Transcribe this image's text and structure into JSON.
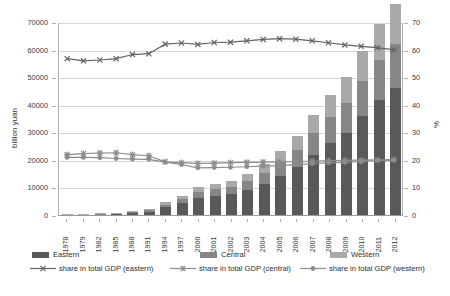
{
  "chart_data": {
    "type": "bar",
    "title": "",
    "subtitle": "",
    "xlabel": "",
    "ylabel": "billion yuan",
    "y2label": "%",
    "ylim": [
      0,
      70000
    ],
    "y2lim": [
      0,
      70
    ],
    "grid": true,
    "legend_position": "bottom",
    "stacked": true,
    "categories": [
      "1978",
      "1979",
      "1982",
      "1985",
      "1988",
      "1991",
      "1994",
      "1997",
      "2000",
      "2001",
      "2002",
      "2003",
      "2004",
      "2005",
      "2006",
      "2007",
      "2008",
      "2009",
      "2010",
      "2011",
      "2012"
    ],
    "yticks": [
      0,
      10000,
      20000,
      30000,
      40000,
      50000,
      60000,
      70000
    ],
    "y2ticks": [
      0,
      10,
      20,
      30,
      40,
      50,
      60,
      70
    ],
    "series": [
      {
        "name": "Eastern",
        "type": "bar",
        "axis": "left",
        "color": "#595959",
        "values": [
          180,
          200,
          260,
          410,
          800,
          1200,
          2800,
          4200,
          6200,
          7000,
          7600,
          9100,
          11300,
          14200,
          17300,
          21800,
          26000,
          29600,
          35800,
          41800,
          46000
        ]
      },
      {
        "name": "Central",
        "type": "bar",
        "axis": "left",
        "color": "#868686",
        "values": [
          70,
          80,
          100,
          160,
          300,
          450,
          1000,
          1500,
          2100,
          2400,
          2600,
          3100,
          3900,
          5000,
          6200,
          7800,
          9500,
          11000,
          12800,
          14600,
          16200
        ]
      },
      {
        "name": "Western",
        "type": "bar",
        "axis": "left",
        "color": "#a9a9a9",
        "values": [
          60,
          70,
          90,
          140,
          260,
          380,
          850,
          1300,
          1800,
          2000,
          2200,
          2600,
          3300,
          4200,
          5200,
          6600,
          8000,
          9400,
          11000,
          12700,
          14200
        ]
      },
      {
        "name": "share in total GDP (eastern)",
        "type": "line",
        "axis": "right",
        "marker": "x",
        "color": "#636363",
        "values": [
          57.0,
          56.2,
          56.5,
          57.0,
          58.5,
          58.8,
          62.3,
          62.7,
          62.2,
          62.9,
          63.0,
          63.5,
          64.0,
          64.3,
          64.1,
          63.5,
          62.8,
          62.0,
          61.5,
          61.0,
          60.2
        ]
      },
      {
        "name": "share in total GDP (central)",
        "type": "line",
        "axis": "right",
        "marker": "asterisk",
        "color": "#8c8c8c",
        "values": [
          22.0,
          22.4,
          22.6,
          22.7,
          22.0,
          21.6,
          19.4,
          19.1,
          18.8,
          18.9,
          19.1,
          19.2,
          19.3,
          19.4,
          19.5,
          19.6,
          19.8,
          19.9,
          20.0,
          20.1,
          20.2
        ]
      },
      {
        "name": "share in total GDP (western)",
        "type": "line",
        "axis": "right",
        "marker": "circle",
        "color": "#8c8c8c",
        "values": [
          21.0,
          21.0,
          20.9,
          20.6,
          20.4,
          20.3,
          19.3,
          18.4,
          17.2,
          17.3,
          17.4,
          17.6,
          17.8,
          18.0,
          18.4,
          18.7,
          19.0,
          19.2,
          19.5,
          19.8,
          20.0
        ]
      }
    ],
    "legend": [
      {
        "label": "Eastern",
        "kind": "swatch",
        "color": "#595959"
      },
      {
        "label": "Central",
        "kind": "swatch",
        "color": "#868686"
      },
      {
        "label": "Western",
        "kind": "swatch",
        "color": "#a9a9a9"
      },
      {
        "label": "share in total GDP (eastern)",
        "kind": "line",
        "marker": "x",
        "color": "#636363"
      },
      {
        "label": "share in total GDP (central)",
        "kind": "line",
        "marker": "asterisk",
        "color": "#8c8c8c"
      },
      {
        "label": "share in total GDP (western)",
        "kind": "line",
        "marker": "circle",
        "color": "#8c8c8c"
      }
    ]
  }
}
